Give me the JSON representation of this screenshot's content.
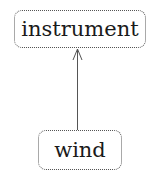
{
  "diagram": {
    "nodes": [
      {
        "id": "instrument",
        "label": "instrument"
      },
      {
        "id": "wind",
        "label": "wind"
      }
    ],
    "edges": [
      {
        "from": "wind",
        "to": "instrument",
        "style": "solid-arrow"
      }
    ],
    "colors": {
      "border": "#555555",
      "text": "#1a1a1a",
      "edge": "#555555",
      "background": "#ffffff"
    }
  }
}
